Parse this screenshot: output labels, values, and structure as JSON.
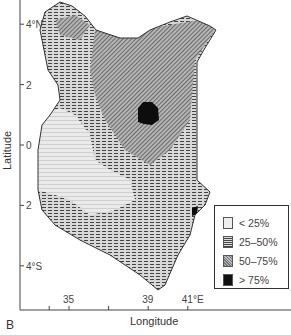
{
  "figure": {
    "panel_label": "B",
    "x_axis": {
      "title": "Longitude",
      "ticks": [
        {
          "value": 34,
          "label": ""
        },
        {
          "value": 35,
          "label": "35"
        },
        {
          "value": 37,
          "label": ""
        },
        {
          "value": 39,
          "label": "39"
        },
        {
          "value": 41,
          "label": "41°E"
        }
      ]
    },
    "y_axis": {
      "title": "Latitude",
      "ticks": [
        {
          "value": 4,
          "label": "4°N"
        },
        {
          "value": 2,
          "label": "2"
        },
        {
          "value": 0,
          "label": "0"
        },
        {
          "value": -2,
          "label": "2"
        },
        {
          "value": -4,
          "label": "4°S"
        }
      ]
    },
    "legend": {
      "items": [
        {
          "label": "< 25%",
          "pattern": "light-grid",
          "color": "#eeeeee"
        },
        {
          "label": "25–50%",
          "pattern": "dashed-hatch",
          "color": "#999999"
        },
        {
          "label": "50–75%",
          "pattern": "diagonal-hatch",
          "color": "#aaaaaa"
        },
        {
          "label": "> 75%",
          "pattern": "solid",
          "color": "#111111"
        }
      ]
    },
    "region": "Kenya",
    "zones": [
      {
        "class": "25–50%",
        "description": "Western, northwestern, eastern and southern Kenya"
      },
      {
        "class": "50–75%",
        "description": "North-central/northeastern Kenya"
      },
      {
        "class": "> 75%",
        "description": "Small patch in north-central Kenya (~1°N, 38°E) and small spots on southeast coast"
      },
      {
        "class": "< 25%",
        "description": "Southwest Kenya highlands and Lake Victoria basin"
      }
    ]
  }
}
